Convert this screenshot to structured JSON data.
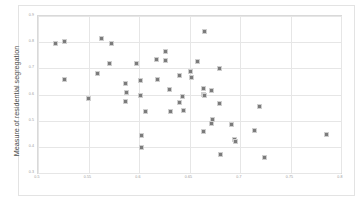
{
  "chart_data": {
    "type": "scatter",
    "title": "",
    "xlabel": "",
    "ylabel": "Measure of residential segregation",
    "legend_label": "Black vs. White Zoning Inequality vs. Segregation Index",
    "legend_position": "bottom-center",
    "grid": true,
    "xlim": [
      0.5,
      0.8
    ],
    "ylim": [
      0.3,
      0.9
    ],
    "xticks": [
      "0.5",
      "0.55",
      "0.6",
      "0.65",
      "0.7",
      "0.75",
      "0.8"
    ],
    "xtick_values": [
      0.5,
      0.55,
      0.6,
      0.65,
      0.7,
      0.75,
      0.8
    ],
    "yticks": [
      "0.3",
      "0.4",
      "0.5",
      "0.6",
      "0.7",
      "0.8",
      "0.9"
    ],
    "ytick_values": [
      0.3,
      0.4,
      0.5,
      0.6,
      0.7,
      0.8,
      0.9
    ],
    "marker_color": "#7b7b7b",
    "series": [
      {
        "name": "Black vs. White Zoning Inequality vs. Segregation Index",
        "points": [
          [
            0.516,
            0.8
          ],
          [
            0.525,
            0.806
          ],
          [
            0.525,
            0.662
          ],
          [
            0.549,
            0.588
          ],
          [
            0.562,
            0.817
          ],
          [
            0.558,
            0.684
          ],
          [
            0.572,
            0.799
          ],
          [
            0.57,
            0.721
          ],
          [
            0.586,
            0.644
          ],
          [
            0.587,
            0.61
          ],
          [
            0.586,
            0.578
          ],
          [
            0.597,
            0.722
          ],
          [
            0.6,
            0.656
          ],
          [
            0.6,
            0.601
          ],
          [
            0.601,
            0.446
          ],
          [
            0.601,
            0.4
          ],
          [
            0.605,
            0.538
          ],
          [
            0.616,
            0.737
          ],
          [
            0.617,
            0.662
          ],
          [
            0.625,
            0.767
          ],
          [
            0.625,
            0.732
          ],
          [
            0.629,
            0.624
          ],
          [
            0.63,
            0.537
          ],
          [
            0.639,
            0.676
          ],
          [
            0.639,
            0.573
          ],
          [
            0.642,
            0.596
          ],
          [
            0.643,
            0.544
          ],
          [
            0.65,
            0.69
          ],
          [
            0.651,
            0.67
          ],
          [
            0.657,
            0.731
          ],
          [
            0.664,
            0.845
          ],
          [
            0.663,
            0.628
          ],
          [
            0.663,
            0.604
          ],
          [
            0.664,
            0.601
          ],
          [
            0.663,
            0.462
          ],
          [
            0.671,
            0.619
          ],
          [
            0.672,
            0.508
          ],
          [
            0.671,
            0.494
          ],
          [
            0.679,
            0.703
          ],
          [
            0.679,
            0.569
          ],
          [
            0.68,
            0.373
          ],
          [
            0.691,
            0.491
          ],
          [
            0.694,
            0.43
          ],
          [
            0.695,
            0.425
          ],
          [
            0.713,
            0.466
          ],
          [
            0.718,
            0.558
          ],
          [
            0.723,
            0.362
          ],
          [
            0.785,
            0.451
          ]
        ]
      }
    ]
  }
}
